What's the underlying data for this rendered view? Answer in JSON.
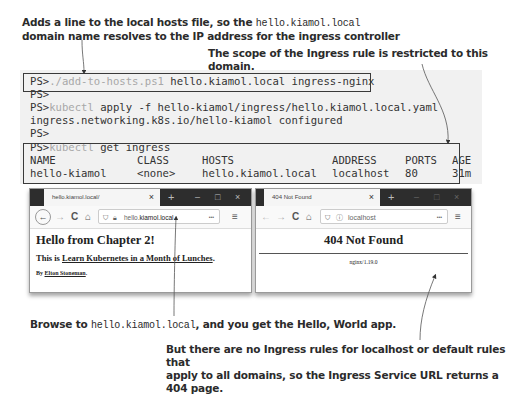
{
  "annotations": {
    "top_left_line1_pre": "Adds a line to the local hosts file, so the ",
    "top_left_line1_code": "hello.kiamol.local",
    "top_left_line2": "domain name resolves to the IP address for the ingress controller",
    "top_right": "The scope of the Ingress rule is restricted to this domain.",
    "bottom_left_pre": "Browse to ",
    "bottom_left_code": "hello.kiamol.local",
    "bottom_left_post": ", and you get the Hello, World app.",
    "bottom_right_line1": "But there are no Ingress rules for localhost or default rules that",
    "bottom_right_line2": "apply to all domains, so the Ingress Service URL returns a 404 page."
  },
  "terminal": {
    "prompt": "PS>",
    "lines": [
      {
        "cmd": "./add-to-hosts.ps1",
        "args": " hello.kiamol.local ingress-nginx"
      },
      {
        "cmd": "",
        "args": ""
      },
      {
        "cmd": "kubectl",
        "args": " apply -f hello-kiamol/ingress/hello.kiamol.local.yaml"
      },
      {
        "output": "ingress.networking.k8s.io/hello-kiamol configured"
      },
      {
        "cmd": "",
        "args": ""
      },
      {
        "cmd": "kubectl",
        "args": " get ingress"
      }
    ],
    "table": {
      "headers": [
        "NAME",
        "CLASS",
        "HOSTS",
        "ADDRESS",
        "PORTS",
        "AGE"
      ],
      "rows": [
        [
          "hello-kiamol",
          "<none>",
          "hello.kiamol.local",
          "localhost",
          "80",
          "31m"
        ]
      ]
    }
  },
  "browser_left": {
    "tab_title": "hello.kiamol.local/",
    "url_pre": "hello.",
    "url_host": "kiamol.local",
    "heading": "Hello from Chapter 2!",
    "para_pre": "This is ",
    "para_link": "Learn Kubernetes in a Month of Lunches",
    "para_post": ".",
    "byline_pre": "By ",
    "byline_link": "Elton Stoneman",
    "byline_post": "."
  },
  "browser_right": {
    "tab_title": "404 Not Found",
    "url": "localhost",
    "heading": "404 Not Found",
    "server": "nginx/1.19.0"
  },
  "browser_controls": {
    "close_tab": "×",
    "new_tab": "+",
    "minimize": "–",
    "maximize": "□",
    "close_window": "×",
    "back": "←",
    "forward": "→",
    "reload": "C",
    "home": "⌂",
    "more": "•••",
    "menu": "≡"
  }
}
